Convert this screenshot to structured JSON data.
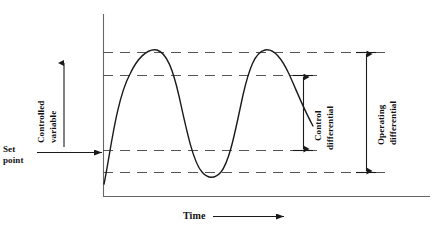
{
  "figure": {
    "background": "#ffffff",
    "line_color": "#1a1a1a",
    "dash_color": "#555555",
    "axis_color": "#555555",
    "width": 442,
    "height": 237
  },
  "axes": {
    "y_axis": {
      "name": "vertical-axis",
      "x": 103,
      "y_top": 14,
      "y_bottom": 196
    },
    "x_axis": {
      "name": "horizontal-axis",
      "y": 196,
      "x_left": 103,
      "x_right": 430
    }
  },
  "labels": {
    "y_axis_label_line1": "Controlled",
    "y_axis_label_line2": "variable",
    "set_point_line1": "Set",
    "set_point_line2": "point",
    "x_axis_label": "Time",
    "control_differential_line1": "Control",
    "control_differential_line2": "differential",
    "operating_differential_line1": "Operating",
    "operating_differential_line2": "differential"
  },
  "reference_lines": [
    {
      "name": "upper-operating-limit",
      "y": 52,
      "x_start": 103,
      "x_end": 388
    },
    {
      "name": "upper-control-limit",
      "y": 75,
      "x_start": 103,
      "x_end": 322
    },
    {
      "name": "lower-control-limit",
      "y": 150,
      "x_start": 103,
      "x_end": 322
    },
    {
      "name": "lower-operating-limit",
      "y": 172,
      "x_start": 103,
      "x_end": 388
    }
  ],
  "arrows": {
    "controlled_variable": {
      "name": "controlled-variable-arrow",
      "x": 64,
      "y_from": 146,
      "y_to": 61,
      "direction": "up"
    },
    "set_point": {
      "name": "set-point-arrow",
      "y": 152,
      "x_from": 37,
      "x_to": 104,
      "direction": "right"
    },
    "time": {
      "name": "time-arrow",
      "y": 216,
      "x_from": 213,
      "x_to": 285,
      "direction": "right"
    },
    "control_differential": {
      "name": "control-differential-arrow",
      "x": 303,
      "y_top": 75,
      "y_bottom": 150,
      "direction": "both"
    },
    "operating_differential": {
      "name": "operating-differential-arrow",
      "x": 366,
      "y_top": 52,
      "y_bottom": 172,
      "direction": "both"
    }
  },
  "curve": {
    "name": "controlled-variable-response-curve",
    "description": "Oscillating sinusoid-like response crossing the set point, peaking at the upper operating limit and troughing at the lower operating limit",
    "peaks_y": 50,
    "troughs_y": 174,
    "set_point_y": 152,
    "path": "M 104,182 C 112,150 118,96 131,72 C 138,58 147,48 156,50 C 166,52 172,66 178,92 C 186,126 192,160 201,172 C 207,180 214,180 220,172 C 229,160 234,126 241,92 C 247,66 254,52 263,50 C 272,48 281,58 288,72 C 295,88 302,106 312,124"
  }
}
